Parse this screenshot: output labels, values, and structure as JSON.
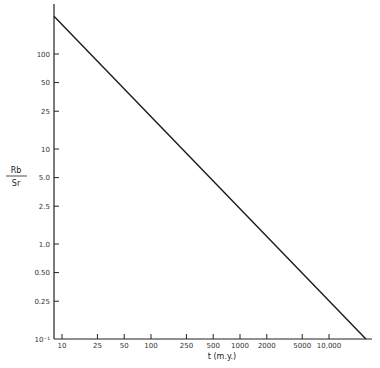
{
  "chart_data": {
    "type": "line",
    "title": "",
    "xlabel": "t (m.y.)",
    "ylabel_numerator": "Rb",
    "ylabel_denominator": "Sr",
    "xscale": "log",
    "yscale": "log",
    "x_ticks": [
      {
        "value": 10,
        "label": "10"
      },
      {
        "value": 25,
        "label": "25"
      },
      {
        "value": 50,
        "label": "50"
      },
      {
        "value": 100,
        "label": "100"
      },
      {
        "value": 250,
        "label": "250"
      },
      {
        "value": 500,
        "label": "500"
      },
      {
        "value": 1000,
        "label": "1000"
      },
      {
        "value": 2000,
        "label": "2000"
      },
      {
        "value": 5000,
        "label": "5000"
      },
      {
        "value": 10000,
        "label": "10,000"
      }
    ],
    "y_ticks": [
      {
        "value": 100,
        "label": "100"
      },
      {
        "value": 50,
        "label": "50"
      },
      {
        "value": 25,
        "label": "25"
      },
      {
        "value": 10,
        "label": "10"
      },
      {
        "value": 5,
        "label": "5.0"
      },
      {
        "value": 2.5,
        "label": "2.5"
      },
      {
        "value": 1,
        "label": "1.0"
      },
      {
        "value": 0.5,
        "label": "0.50"
      },
      {
        "value": 0.25,
        "label": "0.25"
      },
      {
        "value": 0.1,
        "label": "10⁻¹"
      }
    ],
    "xlim": [
      8.1,
      30000
    ],
    "ylim": [
      0.1,
      250
    ],
    "series": [
      {
        "name": "Rb/Sr vs t",
        "x": [
          8.1,
          26000
        ],
        "y": [
          250,
          0.1
        ]
      }
    ],
    "grid": false,
    "legend": null
  }
}
